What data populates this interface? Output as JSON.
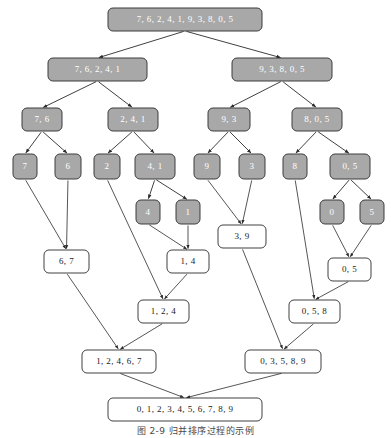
{
  "figure": {
    "caption": "图 2-9  归并排序过程的示例",
    "caption_y": 424,
    "width": 391,
    "height": 438,
    "colors": {
      "split_fill": "#a8a8a8",
      "split_stroke": "#3c3c3c",
      "split_label": "#ffffff",
      "merge_fill": "#ffffff",
      "merge_stroke": "#2b2b2b",
      "merge_label": "#1a1a1a",
      "edge": "#2b2b2b",
      "background": "#ffffff"
    }
  },
  "nodes": [
    {
      "id": "root",
      "label": "7, 6, 2, 4, 1, 9, 3, 8, 0, 5",
      "kind": "split",
      "x": 108,
      "y": 8,
      "w": 154,
      "h": 23,
      "fs": 9
    },
    {
      "id": "L1",
      "label": "7, 6, 2, 4, 1",
      "kind": "split",
      "x": 48,
      "y": 58,
      "w": 99,
      "h": 23,
      "fs": 9
    },
    {
      "id": "R1",
      "label": "9, 3, 8, 0, 5",
      "kind": "split",
      "x": 232,
      "y": 58,
      "w": 100,
      "h": 23,
      "fs": 9
    },
    {
      "id": "L2a",
      "label": "7, 6",
      "kind": "split",
      "x": 22,
      "y": 108,
      "w": 40,
      "h": 23,
      "fs": 9
    },
    {
      "id": "L2b",
      "label": "2, 4, 1",
      "kind": "split",
      "x": 108,
      "y": 108,
      "w": 50,
      "h": 23,
      "fs": 9
    },
    {
      "id": "R2a",
      "label": "9, 3",
      "kind": "split",
      "x": 208,
      "y": 108,
      "w": 42,
      "h": 23,
      "fs": 9
    },
    {
      "id": "R2b",
      "label": "8, 0, 5",
      "kind": "split",
      "x": 292,
      "y": 108,
      "w": 50,
      "h": 23,
      "fs": 9
    },
    {
      "id": "n7",
      "label": "7",
      "kind": "split",
      "x": 13,
      "y": 154,
      "w": 24,
      "h": 25,
      "fs": 9
    },
    {
      "id": "n6",
      "label": "6",
      "kind": "split",
      "x": 55,
      "y": 154,
      "w": 26,
      "h": 25,
      "fs": 9
    },
    {
      "id": "n2",
      "label": "2",
      "kind": "split",
      "x": 94,
      "y": 154,
      "w": 26,
      "h": 25,
      "fs": 9
    },
    {
      "id": "n41",
      "label": "4, 1",
      "kind": "split",
      "x": 135,
      "y": 154,
      "w": 40,
      "h": 25,
      "fs": 9
    },
    {
      "id": "n9",
      "label": "9",
      "kind": "split",
      "x": 194,
      "y": 154,
      "w": 26,
      "h": 25,
      "fs": 9
    },
    {
      "id": "n3",
      "label": "3",
      "kind": "split",
      "x": 239,
      "y": 154,
      "w": 26,
      "h": 25,
      "fs": 9
    },
    {
      "id": "n8",
      "label": "8",
      "kind": "split",
      "x": 283,
      "y": 154,
      "w": 24,
      "h": 25,
      "fs": 9
    },
    {
      "id": "n05s",
      "label": "0, 5",
      "kind": "split",
      "x": 330,
      "y": 154,
      "w": 40,
      "h": 25,
      "fs": 9
    },
    {
      "id": "n4",
      "label": "4",
      "kind": "split",
      "x": 136,
      "y": 200,
      "w": 24,
      "h": 24,
      "fs": 9
    },
    {
      "id": "n1",
      "label": "1",
      "kind": "split",
      "x": 176,
      "y": 200,
      "w": 24,
      "h": 24,
      "fs": 9
    },
    {
      "id": "n0",
      "label": "0",
      "kind": "split",
      "x": 320,
      "y": 200,
      "w": 24,
      "h": 24,
      "fs": 9
    },
    {
      "id": "n5",
      "label": "5",
      "kind": "split",
      "x": 360,
      "y": 200,
      "w": 24,
      "h": 24,
      "fs": 9
    },
    {
      "id": "m39",
      "label": "3, 9",
      "kind": "merge",
      "x": 218,
      "y": 225,
      "w": 48,
      "h": 23,
      "fs": 9
    },
    {
      "id": "m67",
      "label": "6, 7",
      "kind": "merge",
      "x": 44,
      "y": 250,
      "w": 45,
      "h": 23,
      "fs": 9
    },
    {
      "id": "m14",
      "label": "1, 4",
      "kind": "merge",
      "x": 167,
      "y": 250,
      "w": 42,
      "h": 23,
      "fs": 9
    },
    {
      "id": "m05",
      "label": "0, 5",
      "kind": "merge",
      "x": 328,
      "y": 258,
      "w": 43,
      "h": 23,
      "fs": 9
    },
    {
      "id": "m124",
      "label": "1, 2, 4",
      "kind": "merge",
      "x": 138,
      "y": 300,
      "w": 51,
      "h": 23,
      "fs": 9
    },
    {
      "id": "m058",
      "label": "0, 5, 8",
      "kind": "merge",
      "x": 289,
      "y": 300,
      "w": 51,
      "h": 23,
      "fs": 9
    },
    {
      "id": "m12467",
      "label": "1, 2, 4, 6, 7",
      "kind": "merge",
      "x": 82,
      "y": 350,
      "w": 74,
      "h": 23,
      "fs": 9
    },
    {
      "id": "m03589",
      "label": "0, 3, 5, 8, 9",
      "kind": "merge",
      "x": 245,
      "y": 350,
      "w": 76,
      "h": 23,
      "fs": 9
    },
    {
      "id": "final",
      "label": "0, 1, 2, 3, 4, 5, 6, 7, 8, 9",
      "kind": "merge",
      "x": 108,
      "y": 398,
      "w": 154,
      "h": 23,
      "fs": 9
    }
  ],
  "edges": [
    {
      "from": "root",
      "to": "L1",
      "type": "split"
    },
    {
      "from": "root",
      "to": "R1",
      "type": "split"
    },
    {
      "from": "L1",
      "to": "L2a",
      "type": "split"
    },
    {
      "from": "L1",
      "to": "L2b",
      "type": "split"
    },
    {
      "from": "R1",
      "to": "R2a",
      "type": "split"
    },
    {
      "from": "R1",
      "to": "R2b",
      "type": "split"
    },
    {
      "from": "L2a",
      "to": "n7",
      "type": "split"
    },
    {
      "from": "L2a",
      "to": "n6",
      "type": "split"
    },
    {
      "from": "L2b",
      "to": "n2",
      "type": "split"
    },
    {
      "from": "L2b",
      "to": "n41",
      "type": "split"
    },
    {
      "from": "R2a",
      "to": "n9",
      "type": "split"
    },
    {
      "from": "R2a",
      "to": "n3",
      "type": "split"
    },
    {
      "from": "R2b",
      "to": "n8",
      "type": "split"
    },
    {
      "from": "R2b",
      "to": "n05s",
      "type": "split"
    },
    {
      "from": "n41",
      "to": "n4",
      "type": "split"
    },
    {
      "from": "n41",
      "to": "n1",
      "type": "split"
    },
    {
      "from": "n05s",
      "to": "n0",
      "type": "split"
    },
    {
      "from": "n05s",
      "to": "n5",
      "type": "split"
    },
    {
      "from": "n7",
      "to": "m67",
      "type": "merge"
    },
    {
      "from": "n6",
      "to": "m67",
      "type": "merge"
    },
    {
      "from": "n4",
      "to": "m14",
      "type": "merge"
    },
    {
      "from": "n1",
      "to": "m14",
      "type": "merge"
    },
    {
      "from": "n9",
      "to": "m39",
      "type": "merge"
    },
    {
      "from": "n3",
      "to": "m39",
      "type": "merge"
    },
    {
      "from": "n0",
      "to": "m05",
      "type": "merge"
    },
    {
      "from": "n5",
      "to": "m05",
      "type": "merge"
    },
    {
      "from": "n2",
      "to": "m124",
      "type": "merge"
    },
    {
      "from": "m14",
      "to": "m124",
      "type": "merge"
    },
    {
      "from": "n8",
      "to": "m058",
      "type": "merge"
    },
    {
      "from": "m05",
      "to": "m058",
      "type": "merge"
    },
    {
      "from": "m67",
      "to": "m12467",
      "type": "merge"
    },
    {
      "from": "m124",
      "to": "m12467",
      "type": "merge"
    },
    {
      "from": "m39",
      "to": "m03589",
      "type": "merge"
    },
    {
      "from": "m058",
      "to": "m03589",
      "type": "merge"
    },
    {
      "from": "m12467",
      "to": "final",
      "type": "merge"
    },
    {
      "from": "m03589",
      "to": "final",
      "type": "merge"
    }
  ]
}
